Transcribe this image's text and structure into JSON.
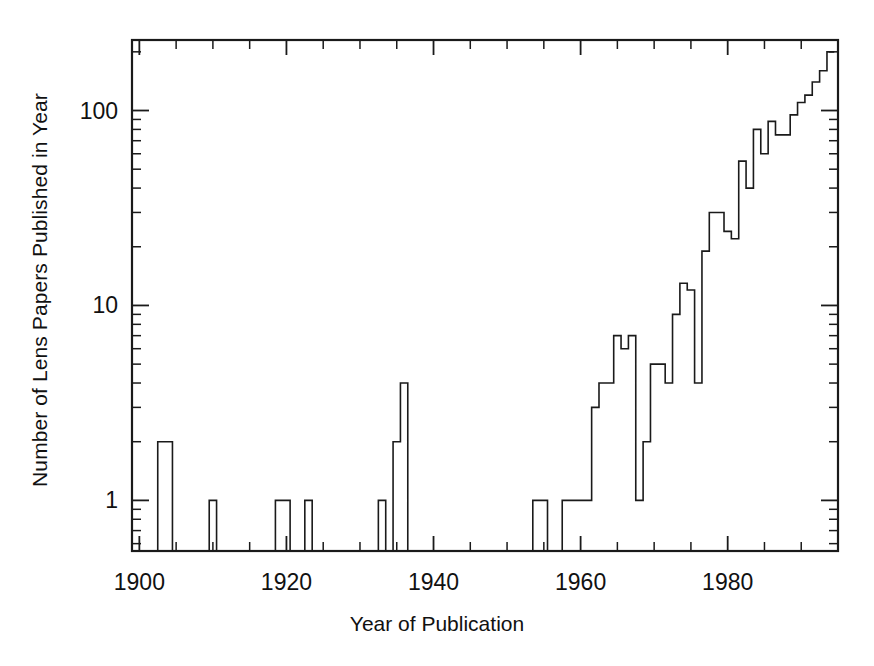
{
  "figure": {
    "background_color": "#ffffff",
    "line_color": "#1a1a1a"
  },
  "axis": {
    "x_label": "Year of Publication",
    "y_label": "Number of Lens Papers Published in Year",
    "x_tick_labels": [
      "1900",
      "1920",
      "1940",
      "1960",
      "1980"
    ],
    "x_tick_values": [
      1900,
      1920,
      1940,
      1960,
      1980
    ],
    "y_tick_labels": [
      "1",
      "10",
      "100"
    ],
    "y_tick_values": [
      1,
      10,
      100
    ]
  },
  "chart_data": {
    "type": "line",
    "subtype": "step-histogram",
    "title": "",
    "xlabel": "Year of Publication",
    "ylabel": "Number of Lens Papers Published in Year",
    "yscale": "log",
    "xscale": "linear",
    "xlim": [
      1899,
      1995
    ],
    "ylim": [
      0.55,
      230
    ],
    "grid": false,
    "legend": false,
    "x": [
      1900,
      1901,
      1902,
      1903,
      1904,
      1905,
      1906,
      1907,
      1908,
      1909,
      1910,
      1911,
      1912,
      1913,
      1914,
      1915,
      1916,
      1917,
      1918,
      1919,
      1920,
      1921,
      1922,
      1923,
      1924,
      1925,
      1926,
      1927,
      1928,
      1929,
      1930,
      1931,
      1932,
      1933,
      1934,
      1935,
      1936,
      1937,
      1938,
      1939,
      1940,
      1941,
      1942,
      1943,
      1944,
      1945,
      1946,
      1947,
      1948,
      1949,
      1950,
      1951,
      1952,
      1953,
      1954,
      1955,
      1956,
      1957,
      1958,
      1959,
      1960,
      1961,
      1962,
      1963,
      1964,
      1965,
      1966,
      1967,
      1968,
      1969,
      1970,
      1971,
      1972,
      1973,
      1974,
      1975,
      1976,
      1977,
      1978,
      1979,
      1980,
      1981,
      1982,
      1983,
      1984,
      1985,
      1986,
      1987,
      1988,
      1989,
      1990,
      1991,
      1992,
      1993,
      1994
    ],
    "values": [
      0,
      0,
      0,
      2,
      2,
      0,
      0,
      0,
      0,
      0,
      1,
      0,
      0,
      0,
      0,
      0,
      0,
      0,
      0,
      1,
      1,
      0,
      0,
      1,
      0,
      0,
      0,
      0,
      0,
      0,
      0,
      0,
      0,
      1,
      0,
      2,
      4,
      0,
      0,
      0,
      0,
      0,
      0,
      0,
      0,
      0,
      0,
      0,
      0,
      0,
      0,
      0,
      0,
      0,
      1,
      1,
      0,
      0,
      1,
      1,
      1,
      1,
      3,
      4,
      4,
      7,
      6,
      7,
      1,
      2,
      5,
      5,
      4,
      9,
      13,
      12,
      4,
      19,
      30,
      30,
      24,
      22,
      55,
      40,
      80,
      60,
      88,
      75,
      75,
      95,
      110,
      120,
      140,
      160,
      200
    ]
  }
}
